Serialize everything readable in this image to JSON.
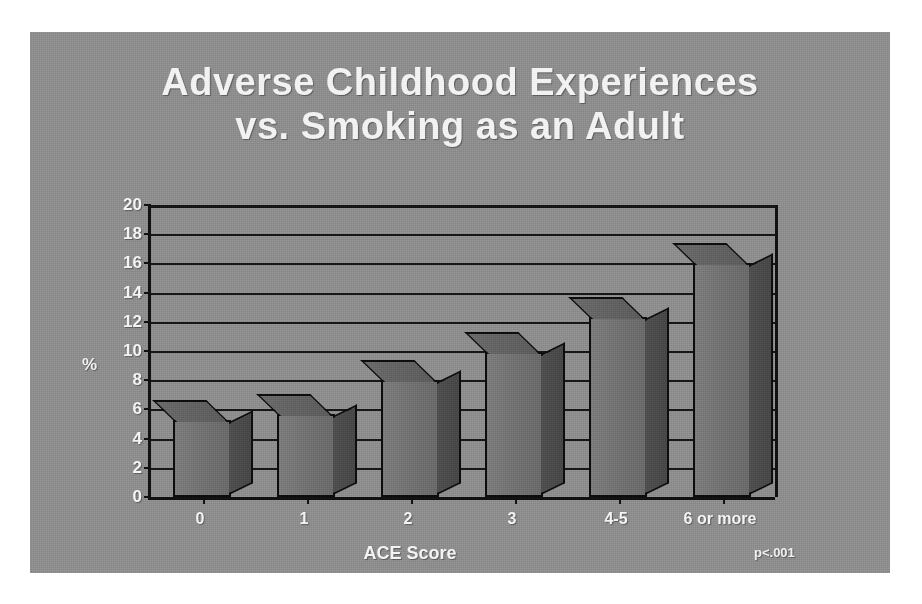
{
  "slide": {
    "title_line1": "Adverse Childhood Experiences",
    "title_line2": "vs. Smoking as an Adult",
    "background_color": "#8e8e8e",
    "title_color": "#f2f2f2"
  },
  "annotations": {
    "p_value": "p<.001"
  },
  "chart_data": {
    "type": "bar",
    "title": "Adverse Childhood Experiences vs. Smoking as an Adult",
    "categories": [
      "0",
      "1",
      "2",
      "3",
      "4-5",
      "6 or more"
    ],
    "values": [
      5.3,
      5.7,
      8.0,
      9.9,
      12.3,
      16.0
    ],
    "xlabel": "ACE Score",
    "ylabel": "%",
    "ylim": [
      0,
      20
    ],
    "ytick_values": [
      0,
      2,
      4,
      6,
      8,
      10,
      12,
      14,
      16,
      18,
      20
    ],
    "ytick_labels": [
      "0",
      "2",
      "4",
      "6",
      "8",
      "10",
      "12",
      "14",
      "16",
      "18",
      "20"
    ],
    "grid": true,
    "legend": "none",
    "series": [
      {
        "name": "Percent smoking as an adult",
        "values": [
          5.3,
          5.7,
          8.0,
          9.9,
          12.3,
          16.0
        ]
      }
    ],
    "annotation": "p<.001",
    "bar_color": "#707070",
    "bar_side_color": "#4a4a4a"
  }
}
